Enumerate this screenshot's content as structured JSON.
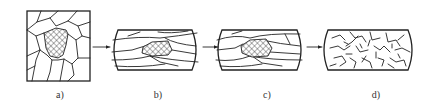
{
  "diagram": {
    "panels": [
      {
        "id": "a",
        "label": "a)",
        "shape": "square",
        "content": "equiaxed grains with one cross-hatched grain"
      },
      {
        "id": "b",
        "label": "b)",
        "shape": "barrel",
        "content": "elongated deformed grains with elongated cross-hatched grain"
      },
      {
        "id": "c",
        "label": "c)",
        "shape": "barrel",
        "content": "elongated deformed grains with cross-hatched grain (polygonized)"
      },
      {
        "id": "d",
        "label": "d)",
        "shape": "barrel",
        "content": "fine recrystallized grains"
      }
    ],
    "arrows": [
      {
        "from": "a",
        "to": "b"
      },
      {
        "from": "b",
        "to": "c"
      },
      {
        "from": "c",
        "to": "d"
      }
    ]
  }
}
